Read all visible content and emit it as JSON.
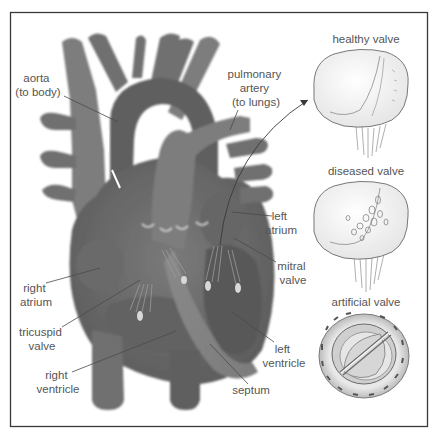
{
  "diagram": {
    "labels": {
      "aorta": [
        "aorta",
        "(to body)"
      ],
      "pulmonary_artery": [
        "pulmonary",
        "artery",
        "(to lungs)"
      ],
      "left_atrium": [
        "left",
        "atrium"
      ],
      "mitral_valve": [
        "mitral",
        "valve"
      ],
      "right_atrium": [
        "right",
        "atrium"
      ],
      "tricuspid_valve": [
        "tricuspid",
        "valve"
      ],
      "right_ventricle": [
        "right",
        "ventricle"
      ],
      "left_ventricle": [
        "left",
        "ventricle"
      ],
      "septum": [
        "septum"
      ]
    },
    "insets": {
      "healthy": "healthy valve",
      "diseased": "diseased valve",
      "artificial": "artificial valve"
    },
    "colors": {
      "frame": "#3a3a3a",
      "heart": "#6f6f6f",
      "label_text": "#555555",
      "leader_line": "#4a4a4a"
    }
  }
}
